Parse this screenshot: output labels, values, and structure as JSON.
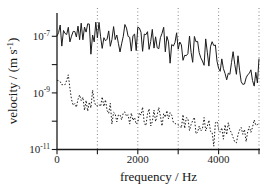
{
  "figure": {
    "background": "#ffffff",
    "ink": "#1b1b1b",
    "gridline_color": "#666666"
  },
  "chart_data": {
    "type": "line",
    "title": "",
    "xlabel": "frequency / Hz",
    "ylabel_parts": [
      {
        "text": "velocity / (m s"
      },
      {
        "text": "-1",
        "sup": true
      },
      {
        "text": ")"
      }
    ],
    "x_axis": {
      "min": 0,
      "max": 5000,
      "tick_values": [
        0,
        1000,
        2000,
        3000,
        4000,
        5000
      ],
      "labeled_ticks": [
        {
          "value": 0,
          "label": "0"
        },
        {
          "value": 2000,
          "label": "2000"
        },
        {
          "value": 4000,
          "label": "4000"
        }
      ],
      "gridline_values": [
        1000,
        2000,
        3000,
        4000,
        5000
      ],
      "grid_style": "dotted-vertical"
    },
    "y_axis": {
      "scale": "log10",
      "unit": "m s-1",
      "min_exponent": -11,
      "max_exponent": -6,
      "tick_exponents": [
        -7,
        -8,
        -9,
        -10,
        -11
      ],
      "labeled_ticks": [
        {
          "exponent": -7,
          "label_base": "10",
          "label_exponent": "-7"
        },
        {
          "exponent": -9,
          "label_base": "10",
          "label_exponent": "-9"
        },
        {
          "exponent": -11,
          "label_base": "10",
          "label_exponent": "-11"
        }
      ]
    },
    "series": [
      {
        "name": "solid-trace",
        "style": "solid",
        "trend": {
          "x_hz": [
            0,
            250,
            500,
            750,
            1000,
            1250,
            1500,
            1750,
            2000,
            2250,
            2500,
            2750,
            3000,
            3250,
            3500,
            3750,
            4000,
            4250,
            4500,
            4750,
            5000
          ],
          "log10_v": [
            -7.0,
            -6.85,
            -6.95,
            -6.9,
            -7.0,
            -6.95,
            -7.05,
            -7.1,
            -7.15,
            -7.05,
            -7.1,
            -7.1,
            -7.4,
            -7.3,
            -7.45,
            -7.6,
            -7.8,
            -7.95,
            -8.15,
            -8.5,
            -8.2
          ]
        },
        "noise_decades": 0.5,
        "spike_probability": 0.12,
        "spike_extra_decades": 0.65,
        "seed": 11
      },
      {
        "name": "dashed-trace",
        "style": "dashed",
        "trend": {
          "x_hz": [
            0,
            250,
            500,
            750,
            1000,
            1250,
            1500,
            1750,
            2000,
            2250,
            2500,
            2750,
            3000,
            3250,
            3500,
            3750,
            4000,
            4250,
            4500,
            4750,
            5000
          ],
          "log10_v": [
            -8.35,
            -8.9,
            -9.3,
            -9.45,
            -9.2,
            -9.6,
            -9.85,
            -10.0,
            -9.85,
            -9.8,
            -9.9,
            -9.95,
            -10.05,
            -10.15,
            -10.1,
            -10.3,
            -10.3,
            -10.4,
            -10.45,
            -10.35,
            -10.15
          ]
        },
        "noise_decades": 0.35,
        "spike_probability": 0.15,
        "spike_extra_decades": 0.5,
        "seed": 29
      }
    ],
    "sample_step_hz": 40
  }
}
